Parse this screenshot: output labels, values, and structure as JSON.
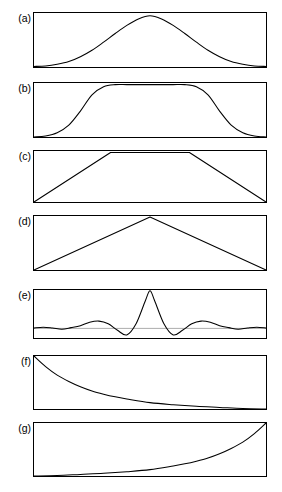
{
  "figure": {
    "title": "",
    "background_color": "#ffffff",
    "line_color": "#000000",
    "baseline_color": "#8a8a8a",
    "panel_left_px": 33,
    "panel_right_px": 267,
    "panel_width_px": 234
  },
  "panels": [
    {
      "label": "(a)",
      "name": "panel-a",
      "top": 12,
      "height": 56,
      "description": "gaussian bell curve",
      "has_baseline": false
    },
    {
      "label": "(b)",
      "name": "panel-b",
      "top": 82,
      "height": 56,
      "description": "flat-top super-gaussian window",
      "has_baseline": false
    },
    {
      "label": "(c)",
      "name": "panel-c",
      "top": 150,
      "height": 53,
      "description": "trapezoid",
      "has_baseline": false
    },
    {
      "label": "(d)",
      "name": "panel-d",
      "top": 215,
      "height": 56,
      "description": "triangle",
      "has_baseline": false
    },
    {
      "label": "(e)",
      "name": "panel-e",
      "top": 289,
      "height": 50,
      "description": "sinc function with side lobes",
      "has_baseline": true
    },
    {
      "label": "(f)",
      "name": "panel-f",
      "top": 355,
      "height": 55,
      "description": "exponential decay",
      "has_baseline": false
    },
    {
      "label": "(g)",
      "name": "panel-g",
      "top": 422,
      "height": 55,
      "description": "exponential rise",
      "has_baseline": false
    }
  ],
  "chart_data": [
    {
      "type": "line",
      "id": "a",
      "title": "(a)",
      "xlabel": "",
      "ylabel": "",
      "xlim": [
        0,
        1
      ],
      "ylim": [
        0,
        1
      ],
      "grid": false,
      "legend": "none",
      "function": "gaussian",
      "series": [
        {
          "name": "gaussian",
          "x": [
            0.0,
            0.05,
            0.1,
            0.15,
            0.2,
            0.25,
            0.3,
            0.35,
            0.4,
            0.45,
            0.5,
            0.55,
            0.6,
            0.65,
            0.7,
            0.75,
            0.8,
            0.85,
            0.9,
            0.95,
            1.0
          ],
          "values": [
            0.01,
            0.02,
            0.05,
            0.1,
            0.19,
            0.31,
            0.46,
            0.62,
            0.77,
            0.89,
            0.95,
            0.89,
            0.77,
            0.62,
            0.46,
            0.31,
            0.19,
            0.1,
            0.05,
            0.02,
            0.01
          ]
        }
      ]
    },
    {
      "type": "line",
      "id": "b",
      "title": "(b)",
      "xlabel": "",
      "ylabel": "",
      "xlim": [
        0,
        1
      ],
      "ylim": [
        0,
        1
      ],
      "grid": false,
      "legend": "none",
      "function": "super-gaussian flat top",
      "series": [
        {
          "name": "flat-top",
          "x": [
            0.0,
            0.05,
            0.1,
            0.15,
            0.2,
            0.25,
            0.3,
            0.35,
            0.4,
            0.45,
            0.5,
            0.55,
            0.6,
            0.65,
            0.7,
            0.75,
            0.8,
            0.85,
            0.9,
            0.95,
            1.0
          ],
          "values": [
            0.0,
            0.02,
            0.08,
            0.22,
            0.48,
            0.78,
            0.93,
            0.97,
            0.97,
            0.97,
            0.97,
            0.97,
            0.97,
            0.97,
            0.93,
            0.78,
            0.48,
            0.22,
            0.08,
            0.02,
            0.0
          ]
        }
      ]
    },
    {
      "type": "line",
      "id": "c",
      "title": "(c)",
      "xlabel": "",
      "ylabel": "",
      "xlim": [
        0,
        1
      ],
      "ylim": [
        0,
        1
      ],
      "grid": false,
      "legend": "none",
      "function": "trapezoid",
      "series": [
        {
          "name": "trapezoid",
          "x": [
            0.0,
            0.33,
            0.67,
            1.0
          ],
          "values": [
            0.0,
            0.97,
            0.97,
            0.0
          ]
        }
      ]
    },
    {
      "type": "line",
      "id": "d",
      "title": "(d)",
      "xlabel": "",
      "ylabel": "",
      "xlim": [
        0,
        1
      ],
      "ylim": [
        0,
        1
      ],
      "grid": false,
      "legend": "none",
      "function": "triangle",
      "series": [
        {
          "name": "triangle",
          "x": [
            0.0,
            0.5,
            1.0
          ],
          "values": [
            0.0,
            0.98,
            0.0
          ]
        }
      ]
    },
    {
      "type": "line",
      "id": "e",
      "title": "(e)",
      "xlabel": "",
      "ylabel": "",
      "xlim": [
        0,
        1
      ],
      "ylim": [
        -0.25,
        1.0
      ],
      "grid": false,
      "legend": "none",
      "function": "sinc",
      "baseline_value": 0,
      "series": [
        {
          "name": "sinc",
          "x": [
            0.0,
            0.04,
            0.08,
            0.12,
            0.16,
            0.2,
            0.24,
            0.28,
            0.32,
            0.36,
            0.4,
            0.44,
            0.48,
            0.5,
            0.52,
            0.56,
            0.6,
            0.64,
            0.68,
            0.72,
            0.76,
            0.8,
            0.84,
            0.88,
            0.92,
            0.96,
            1.0
          ],
          "values": [
            0.01,
            0.03,
            0.01,
            -0.02,
            0.02,
            0.07,
            0.16,
            0.19,
            0.12,
            -0.05,
            -0.17,
            0.12,
            0.72,
            0.98,
            0.72,
            0.12,
            -0.17,
            -0.05,
            0.12,
            0.19,
            0.16,
            0.07,
            0.02,
            -0.02,
            0.01,
            0.03,
            0.01
          ]
        }
      ]
    },
    {
      "type": "line",
      "id": "f",
      "title": "(f)",
      "xlabel": "",
      "ylabel": "",
      "xlim": [
        0,
        1
      ],
      "ylim": [
        0,
        1
      ],
      "grid": false,
      "legend": "none",
      "function": "exponential decay",
      "series": [
        {
          "name": "decay",
          "x": [
            0.0,
            0.05,
            0.1,
            0.15,
            0.2,
            0.25,
            0.3,
            0.35,
            0.4,
            0.5,
            0.6,
            0.7,
            0.8,
            0.9,
            1.0
          ],
          "values": [
            1.0,
            0.8,
            0.64,
            0.52,
            0.42,
            0.34,
            0.28,
            0.23,
            0.19,
            0.12,
            0.08,
            0.05,
            0.03,
            0.01,
            0.0
          ]
        }
      ]
    },
    {
      "type": "line",
      "id": "g",
      "title": "(g)",
      "xlabel": "",
      "ylabel": "",
      "xlim": [
        0,
        1
      ],
      "ylim": [
        0,
        1
      ],
      "grid": false,
      "legend": "none",
      "function": "exponential rise",
      "series": [
        {
          "name": "rise",
          "x": [
            0.0,
            0.1,
            0.2,
            0.3,
            0.4,
            0.5,
            0.6,
            0.65,
            0.7,
            0.75,
            0.8,
            0.85,
            0.9,
            0.95,
            1.0
          ],
          "values": [
            0.0,
            0.01,
            0.03,
            0.05,
            0.08,
            0.12,
            0.19,
            0.23,
            0.28,
            0.34,
            0.42,
            0.52,
            0.64,
            0.8,
            1.0
          ]
        }
      ]
    }
  ]
}
